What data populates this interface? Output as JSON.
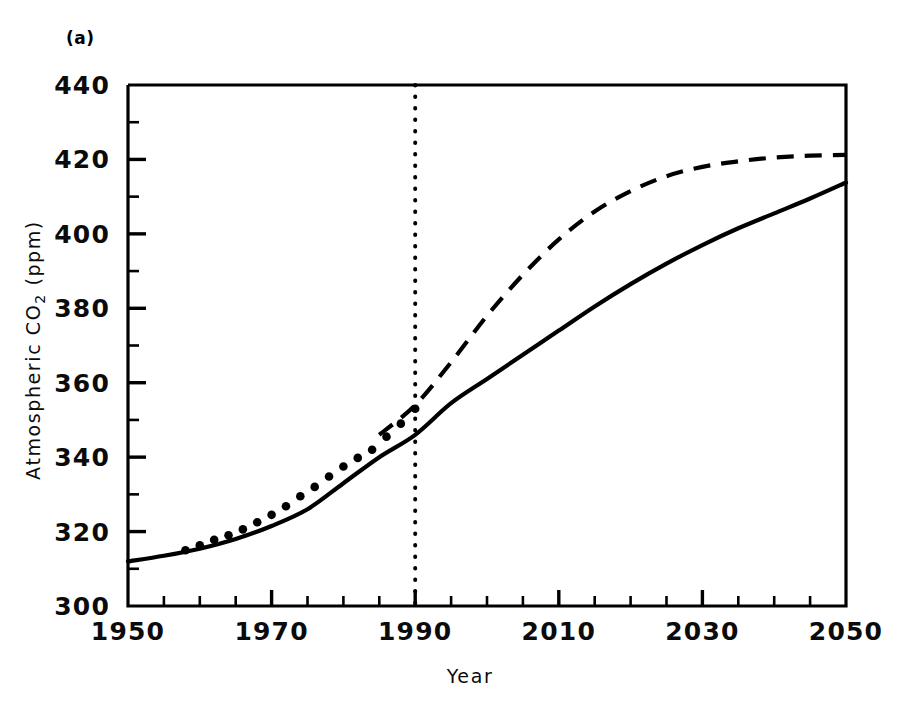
{
  "figure": {
    "panel_label": "(a)",
    "background_color": "#ffffff",
    "ink_color": "#000000"
  },
  "chart_data": {
    "type": "line",
    "title": "",
    "subtitle": "",
    "panel": "(a)",
    "xlabel": "Year",
    "ylabel": "Atmospheric CO2 (ppm)",
    "ylabel_parts": {
      "pre": "Atmospheric CO",
      "sub": "2",
      "post": " (ppm)"
    },
    "xlim": [
      1950,
      2050
    ],
    "ylim": [
      300,
      440
    ],
    "grid": false,
    "legend": "none",
    "x_major_ticks": [
      1950,
      1970,
      1990,
      2010,
      2030,
      2050
    ],
    "x_major_tick_labels": [
      "1950",
      "1970",
      "1990",
      "2010",
      "2030",
      "2050"
    ],
    "x_minor_tick_step": 5,
    "y_major_ticks": [
      300,
      320,
      340,
      360,
      380,
      400,
      420,
      440
    ],
    "y_major_tick_labels": [
      "300",
      "320",
      "340",
      "360",
      "380",
      "400",
      "420",
      "440"
    ],
    "y_minor_tick_step": 10,
    "annotations": [
      {
        "name": "present-day-marker",
        "type": "vertical-dotted-line",
        "x": 1990,
        "label": ""
      }
    ],
    "series": [
      {
        "name": "low-emissions-scenario",
        "style": "solid",
        "x": [
          1950,
          1955,
          1960,
          1965,
          1970,
          1975,
          1980,
          1985,
          1990,
          1995,
          2000,
          2005,
          2010,
          2015,
          2020,
          2025,
          2030,
          2035,
          2040,
          2045,
          2050
        ],
        "values": [
          312.0,
          313.5,
          315.4,
          318.0,
          321.5,
          326.0,
          333.0,
          340.0,
          346.0,
          354.5,
          361.0,
          367.5,
          374.0,
          380.5,
          386.5,
          392.0,
          397.0,
          401.5,
          405.5,
          409.5,
          413.8
        ]
      },
      {
        "name": "high-emissions-scenario",
        "style": "dashed",
        "x": [
          1985,
          1990,
          1995,
          2000,
          2005,
          2010,
          2015,
          2020,
          2025,
          2030,
          2035,
          2040,
          2045,
          2050
        ],
        "values": [
          346.0,
          354.0,
          365.5,
          378.0,
          389.0,
          398.5,
          406.0,
          411.5,
          415.5,
          418.0,
          419.5,
          420.5,
          421.0,
          421.2
        ]
      },
      {
        "name": "observed-co2-measurements",
        "style": "filled-circles",
        "x": [
          1958,
          1960,
          1962,
          1964,
          1966,
          1968,
          1970,
          1972,
          1974,
          1976,
          1978,
          1980,
          1982,
          1984,
          1986,
          1988,
          1990
        ],
        "values": [
          315.0,
          316.3,
          317.8,
          319.0,
          320.6,
          322.5,
          324.5,
          326.8,
          329.5,
          332.0,
          334.8,
          337.5,
          339.8,
          342.0,
          345.5,
          349.0,
          353.0
        ]
      }
    ]
  }
}
